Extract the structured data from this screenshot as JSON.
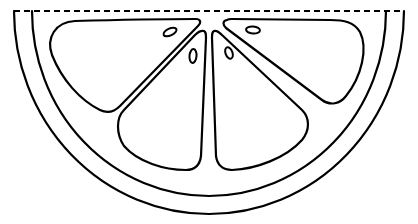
{
  "illustration": {
    "subject": "citrus-slice",
    "style": "line-art coloring page",
    "colors": {
      "background": "#ffffff",
      "stroke": "#000000"
    },
    "cut_line": {
      "x1": 14,
      "x2": 404,
      "y": 11,
      "dashed": true
    },
    "outer_peel": {
      "left_x": 14,
      "right_x": 404,
      "top_y": 11,
      "bottom_y": 214
    },
    "inner_rind": {
      "left_x": 32,
      "right_x": 386,
      "top_y": 11,
      "bottom_y": 196
    },
    "segments": [
      {
        "name": "segment-top-left"
      },
      {
        "name": "segment-bottom-left"
      },
      {
        "name": "segment-bottom-right"
      },
      {
        "name": "segment-top-right"
      }
    ],
    "seeds": [
      {
        "cx": 170,
        "cy": 32,
        "rx": 7,
        "ry": 3.5,
        "rotate": -25
      },
      {
        "cx": 193,
        "cy": 56,
        "rx": 3.5,
        "ry": 7,
        "rotate": 5
      },
      {
        "cx": 229,
        "cy": 53,
        "rx": 3.5,
        "ry": 6,
        "rotate": -20
      },
      {
        "cx": 253,
        "cy": 30,
        "rx": 7,
        "ry": 3.5,
        "rotate": 5
      }
    ]
  }
}
